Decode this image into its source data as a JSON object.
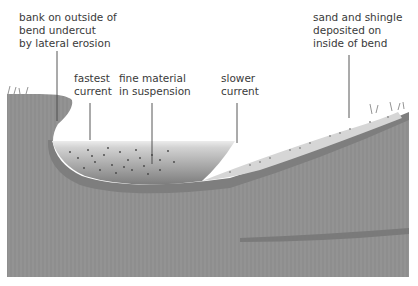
{
  "diagram": {
    "labels": {
      "bank": "bank on outside of\nbend undercut\nby lateral erosion",
      "fastest": "fastest\ncurrent",
      "fine": "fine material\nin suspension",
      "slower": "slower\ncurrent",
      "sand": "sand and shingle\ndeposited on\ninside of bend"
    },
    "colors": {
      "ground": "#8f8f8f",
      "ground_dark": "#7c7c7c",
      "water_top": "#e6e6e6",
      "water_bottom": "#8a8a8a",
      "sand": "#d4d4d4",
      "text": "#3a3a3a",
      "leader": "#444444"
    }
  }
}
